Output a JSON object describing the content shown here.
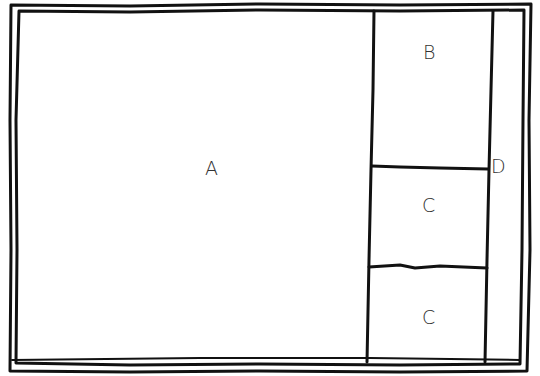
{
  "diagram": {
    "type": "layout-wireframe",
    "style": "hand-drawn",
    "colors": {
      "stroke": "#111111",
      "background": "#ffffff",
      "label": "#333333"
    },
    "regions": [
      {
        "id": "A",
        "label": "A"
      },
      {
        "id": "B",
        "label": "B"
      },
      {
        "id": "C1",
        "label": "C"
      },
      {
        "id": "C2",
        "label": "C"
      },
      {
        "id": "D",
        "label": "D"
      }
    ]
  }
}
